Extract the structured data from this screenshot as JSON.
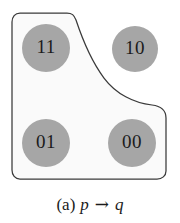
{
  "figure": {
    "caption": {
      "tag": "(a)",
      "antecedent": "p",
      "operator": "→",
      "consequent": "q",
      "full_text": "(a) p → q"
    },
    "region": {
      "name": "truth-region",
      "shape": "rounded-L",
      "fill_color": "#fafafa",
      "stroke_color": "#3a3a3a",
      "contains": [
        "11",
        "01",
        "00"
      ],
      "excludes": [
        "10"
      ]
    },
    "nodes": [
      {
        "id": "node-11",
        "label": "11",
        "cx": 46,
        "cy": 48,
        "r": 24,
        "fill": "#a6a6a6",
        "inside_region": true
      },
      {
        "id": "node-10",
        "label": "10",
        "cx": 135,
        "cy": 49,
        "r": 23,
        "fill": "#a6a6a6",
        "inside_region": false
      },
      {
        "id": "node-01",
        "label": "01",
        "cx": 46,
        "cy": 143,
        "r": 24,
        "fill": "#a6a6a6",
        "inside_region": true
      },
      {
        "id": "node-00",
        "label": "00",
        "cx": 132,
        "cy": 143,
        "r": 24,
        "fill": "#a6a6a6",
        "inside_region": true
      }
    ]
  }
}
